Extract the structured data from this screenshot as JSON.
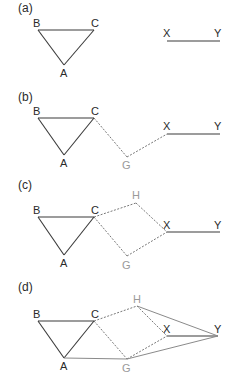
{
  "diagram": {
    "panels": [
      {
        "label": "(a)",
        "nodes": [
          {
            "id": "B",
            "label": "B",
            "x": 38,
            "y": 30,
            "color": "#2a2a2a"
          },
          {
            "id": "C",
            "label": "C",
            "x": 94,
            "y": 30,
            "color": "#2a2a2a"
          },
          {
            "id": "A",
            "label": "A",
            "x": 64,
            "y": 65,
            "color": "#2a2a2a"
          },
          {
            "id": "X",
            "label": "X",
            "x": 167,
            "y": 41,
            "color": "#2a2a2a"
          },
          {
            "id": "Y",
            "label": "Y",
            "x": 220,
            "y": 41,
            "color": "#2a2a2a"
          }
        ],
        "edges": [
          {
            "from": "B",
            "to": "C",
            "style": "solid"
          },
          {
            "from": "C",
            "to": "A",
            "style": "solid"
          },
          {
            "from": "A",
            "to": "B",
            "style": "solid"
          },
          {
            "from": "X",
            "to": "Y",
            "style": "solid"
          }
        ]
      },
      {
        "label": "(b)",
        "nodes": [
          {
            "id": "B",
            "label": "B",
            "x": 38,
            "y": 118,
            "color": "#2a2a2a"
          },
          {
            "id": "C",
            "label": "C",
            "x": 94,
            "y": 118,
            "color": "#2a2a2a"
          },
          {
            "id": "A",
            "label": "A",
            "x": 64,
            "y": 155,
            "color": "#2a2a2a"
          },
          {
            "id": "G",
            "label": "G",
            "x": 127,
            "y": 157,
            "color": "#9a9a9a"
          },
          {
            "id": "X",
            "label": "X",
            "x": 167,
            "y": 133,
            "color": "#2a2a2a"
          },
          {
            "id": "Y",
            "label": "Y",
            "x": 220,
            "y": 133,
            "color": "#2a2a2a"
          }
        ],
        "edges": [
          {
            "from": "B",
            "to": "C",
            "style": "solid"
          },
          {
            "from": "C",
            "to": "A",
            "style": "solid"
          },
          {
            "from": "A",
            "to": "B",
            "style": "solid"
          },
          {
            "from": "C",
            "to": "G",
            "style": "dotted"
          },
          {
            "from": "G",
            "to": "X",
            "style": "dotted"
          },
          {
            "from": "X",
            "to": "Y",
            "style": "solid"
          }
        ]
      },
      {
        "label": "(c)",
        "nodes": [
          {
            "id": "B",
            "label": "B",
            "x": 38,
            "y": 217,
            "color": "#2a2a2a"
          },
          {
            "id": "C",
            "label": "C",
            "x": 94,
            "y": 217,
            "color": "#2a2a2a"
          },
          {
            "id": "A",
            "label": "A",
            "x": 64,
            "y": 255,
            "color": "#2a2a2a"
          },
          {
            "id": "H",
            "label": "H",
            "x": 136,
            "y": 203,
            "color": "#9a9a9a"
          },
          {
            "id": "G",
            "label": "G",
            "x": 127,
            "y": 257,
            "color": "#9a9a9a"
          },
          {
            "id": "X",
            "label": "X",
            "x": 167,
            "y": 232,
            "color": "#2a2a2a"
          },
          {
            "id": "Y",
            "label": "Y",
            "x": 220,
            "y": 232,
            "color": "#2a2a2a"
          }
        ],
        "edges": [
          {
            "from": "B",
            "to": "C",
            "style": "solid"
          },
          {
            "from": "C",
            "to": "A",
            "style": "solid"
          },
          {
            "from": "A",
            "to": "B",
            "style": "solid"
          },
          {
            "from": "C",
            "to": "H",
            "style": "dotted"
          },
          {
            "from": "H",
            "to": "X",
            "style": "dotted"
          },
          {
            "from": "C",
            "to": "G",
            "style": "dotted"
          },
          {
            "from": "G",
            "to": "X",
            "style": "dotted"
          },
          {
            "from": "X",
            "to": "Y",
            "style": "solid"
          }
        ]
      },
      {
        "label": "(d)",
        "nodes": [
          {
            "id": "B",
            "label": "B",
            "x": 38,
            "y": 321,
            "color": "#2a2a2a"
          },
          {
            "id": "C",
            "label": "C",
            "x": 94,
            "y": 321,
            "color": "#2a2a2a"
          },
          {
            "id": "A",
            "label": "A",
            "x": 64,
            "y": 358,
            "color": "#2a2a2a"
          },
          {
            "id": "H",
            "label": "H",
            "x": 137,
            "y": 306,
            "color": "#9a9a9a"
          },
          {
            "id": "G",
            "label": "G",
            "x": 127,
            "y": 360,
            "color": "#9a9a9a"
          },
          {
            "id": "X",
            "label": "X",
            "x": 167,
            "y": 336,
            "color": "#2a2a2a"
          },
          {
            "id": "Y",
            "label": "Y",
            "x": 218,
            "y": 336,
            "color": "#2a2a2a"
          }
        ],
        "edges": [
          {
            "from": "B",
            "to": "C",
            "style": "solid"
          },
          {
            "from": "C",
            "to": "A",
            "style": "solid"
          },
          {
            "from": "A",
            "to": "B",
            "style": "solid"
          },
          {
            "from": "C",
            "to": "H",
            "style": "dotted"
          },
          {
            "from": "H",
            "to": "X",
            "style": "dotted"
          },
          {
            "from": "C",
            "to": "G",
            "style": "dotted"
          },
          {
            "from": "G",
            "to": "X",
            "style": "dotted"
          },
          {
            "from": "X",
            "to": "Y",
            "style": "solid"
          },
          {
            "from": "A",
            "to": "G",
            "style": "solid-gray"
          },
          {
            "from": "G",
            "to": "Y",
            "style": "solid-gray"
          },
          {
            "from": "H",
            "to": "Y",
            "style": "solid-gray"
          }
        ]
      }
    ]
  }
}
